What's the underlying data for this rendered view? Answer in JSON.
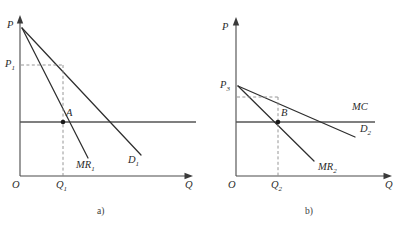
{
  "figure": {
    "width": 412,
    "height": 228,
    "background": "#ffffff",
    "curve_color": "#2e2e2e",
    "axis_color": "#4a4a4a",
    "dash_color": "#8a8a8a",
    "dot_color": "#1a1a1a"
  },
  "chart_data": {
    "type": "line",
    "title": "",
    "panels": [
      {
        "id": "a",
        "caption": "a)",
        "xlabel": "Q",
        "ylabel": "P",
        "origin_label": "O",
        "grid": false,
        "legend": "inline-curve-labels",
        "axis_ranges": {
          "x": [
            0,
            1
          ],
          "y": [
            0,
            1
          ]
        },
        "curves": [
          {
            "name": "D1",
            "label": "D",
            "label_sub": "1",
            "kind": "demand",
            "points": [
              [
                0.0,
                1.0
              ],
              [
                0.78,
                0.0
              ]
            ]
          },
          {
            "name": "MR1",
            "label": "MR",
            "label_sub": "1",
            "kind": "marginal-revenue",
            "points": [
              [
                0.0,
                1.0
              ],
              [
                0.42,
                0.0
              ]
            ]
          },
          {
            "name": "MC1",
            "label": "",
            "kind": "marginal-cost-horizontal",
            "points": [
              [
                0.0,
                0.36
              ],
              [
                1.0,
                0.36
              ]
            ]
          }
        ],
        "guides": [
          {
            "name": "price-guide",
            "from": [
              0.0,
              0.72
            ],
            "to": [
              0.29,
              0.72
            ],
            "style": "dashed"
          },
          {
            "name": "quantity-guide",
            "from": [
              0.29,
              0.72
            ],
            "to": [
              0.29,
              0.0
            ],
            "style": "dashed"
          }
        ],
        "points": [
          {
            "name": "A",
            "label": "A",
            "x": 0.29,
            "y": 0.36
          }
        ],
        "tick_labels": [
          {
            "axis": "y",
            "label": "P",
            "sub": "1",
            "value": 0.72
          },
          {
            "axis": "x",
            "label": "Q",
            "sub": "1",
            "value": 0.29
          }
        ]
      },
      {
        "id": "b",
        "caption": "b)",
        "xlabel": "Q",
        "ylabel": "P",
        "origin_label": "O",
        "grid": false,
        "legend": "inline-curve-labels",
        "axis_ranges": {
          "x": [
            0,
            1
          ],
          "y": [
            0,
            1
          ]
        },
        "curves": [
          {
            "name": "D2",
            "label": "D",
            "label_sub": "2",
            "kind": "demand",
            "points": [
              [
                0.0,
                0.7
              ],
              [
                0.9,
                0.26
              ]
            ]
          },
          {
            "name": "MR2",
            "label": "MR",
            "label_sub": "2",
            "kind": "marginal-revenue",
            "points": [
              [
                0.0,
                0.7
              ],
              [
                0.58,
                0.06
              ]
            ]
          },
          {
            "name": "MC",
            "label": "MC",
            "label_sub": "",
            "kind": "marginal-cost-horizontal",
            "points": [
              [
                0.0,
                0.4
              ],
              [
                1.0,
                0.4
              ]
            ]
          }
        ],
        "guides": [
          {
            "name": "price-guide",
            "from": [
              0.0,
              0.62
            ],
            "to": [
              0.28,
              0.62
            ],
            "style": "dashed"
          },
          {
            "name": "quantity-guide",
            "from": [
              0.28,
              0.62
            ],
            "to": [
              0.28,
              0.0
            ],
            "style": "dashed"
          }
        ],
        "points": [
          {
            "name": "B",
            "label": "B",
            "x": 0.28,
            "y": 0.4
          }
        ],
        "tick_labels": [
          {
            "axis": "y",
            "label": "P",
            "sub": "3",
            "value": 0.7
          },
          {
            "axis": "x",
            "label": "Q",
            "sub": "2",
            "value": 0.28
          }
        ]
      }
    ]
  },
  "panel_a": {
    "axis_p_label": "P",
    "axis_q_label": "Q",
    "origin_label": "O",
    "price_label": "P",
    "price_sub": "1",
    "quantity_label": "Q",
    "quantity_sub": "1",
    "point_label": "A",
    "mr_label": "MR",
    "mr_sub": "1",
    "d_label": "D",
    "d_sub": "1",
    "caption": "a)"
  },
  "panel_b": {
    "axis_p_label": "P",
    "axis_q_label": "Q",
    "origin_label": "O",
    "price_label": "P",
    "price_sub": "3",
    "quantity_label": "Q",
    "quantity_sub": "2",
    "point_label": "B",
    "mr_label": "MR",
    "mr_sub": "2",
    "d_label": "D",
    "d_sub": "2",
    "mc_label": "MC",
    "caption": "b)"
  }
}
